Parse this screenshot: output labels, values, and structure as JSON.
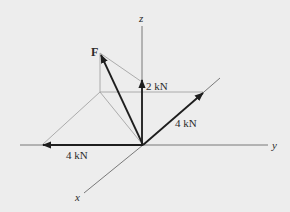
{
  "diagram": {
    "type": "3D force vector diagram",
    "axes": {
      "x": {
        "label": "x"
      },
      "y": {
        "label": "y"
      },
      "z": {
        "label": "z"
      }
    },
    "resultant": {
      "label": "F"
    },
    "components": [
      {
        "name": "z-component",
        "label": "2 kN",
        "direction": "+z"
      },
      {
        "name": "y-component",
        "label": "4 kN",
        "direction": "+y"
      },
      {
        "name": "negative-y-component",
        "label": "4 kN",
        "direction": "-y"
      }
    ],
    "colors": {
      "background": "#ededed",
      "vector": "#1e1e1e",
      "axis": "#5a5a5a",
      "construction": "#9a9a9a"
    }
  }
}
